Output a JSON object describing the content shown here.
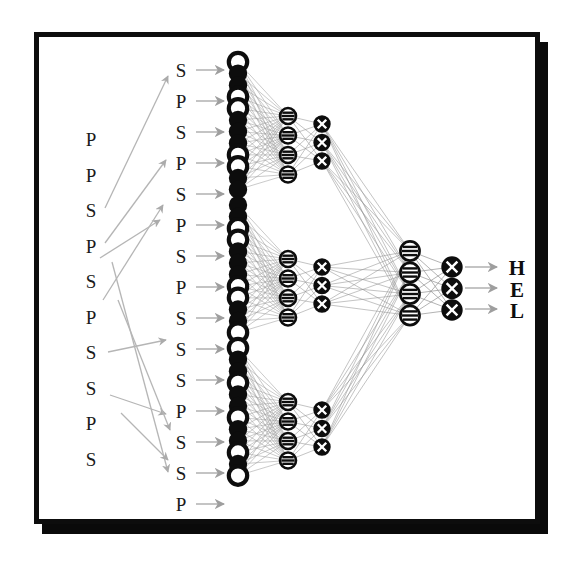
{
  "figure": {
    "kind": "neural-network-diagram",
    "caption_text": "",
    "frame": {
      "border_color": "#0d0d0d",
      "shadow_color": "#0a0a0a",
      "background": "#ffffff"
    },
    "colors": {
      "node_fill": "#0d0d0d",
      "node_hollow": "#ffffff",
      "node_stroke": "#0d0d0d",
      "edge": "#8a8a8a",
      "arrow": "#9a9a9a",
      "text": "#1a1a1a"
    }
  },
  "input_sequence": {
    "name": "outer-sequence",
    "label": "outer input letters",
    "letters": [
      "P",
      "P",
      "S",
      "P",
      "S",
      "P",
      "S",
      "S",
      "P",
      "S"
    ]
  },
  "window_sequence": {
    "name": "windowed-sequence",
    "label": "expanded windowed input letters",
    "letters": [
      "S",
      "P",
      "S",
      "P",
      "S",
      "P",
      "S",
      "P",
      "S",
      "S",
      "S",
      "P",
      "S",
      "S",
      "P"
    ]
  },
  "output_labels": {
    "name": "output-letters",
    "letters": [
      "H",
      "E",
      "L"
    ]
  },
  "layers": [
    {
      "id": "input-layer",
      "label": "Input layer",
      "glyph": "solid-or-hollow-circle",
      "groups": [
        {
          "id": "input-group-1",
          "nodes": [
            "hollow",
            "solid",
            "solid",
            "hollow",
            "hollow",
            "solid",
            "solid",
            "solid",
            "hollow",
            "hollow",
            "solid",
            "solid"
          ]
        },
        {
          "id": "input-group-2",
          "nodes": [
            "solid",
            "solid",
            "hollow",
            "hollow",
            "solid",
            "solid",
            "solid",
            "hollow",
            "hollow",
            "solid",
            "solid",
            "hollow"
          ]
        },
        {
          "id": "input-group-3",
          "nodes": [
            "hollow",
            "solid",
            "solid",
            "hollow",
            "solid",
            "solid",
            "hollow",
            "solid",
            "solid",
            "hollow",
            "solid",
            "hollow"
          ]
        }
      ]
    },
    {
      "id": "hidden-layer-1",
      "label": "First hidden layer",
      "glyph": "striped-circle",
      "groups": [
        {
          "id": "h1-group-1",
          "count": 4
        },
        {
          "id": "h1-group-2",
          "count": 4
        },
        {
          "id": "h1-group-3",
          "count": 4
        }
      ]
    },
    {
      "id": "hidden-layer-2",
      "label": "Second hidden layer",
      "glyph": "crossed-circle",
      "groups": [
        {
          "id": "h2-group-1",
          "count": 3
        },
        {
          "id": "h2-group-2",
          "count": 3
        },
        {
          "id": "h2-group-3",
          "count": 3
        }
      ]
    },
    {
      "id": "hidden-layer-3",
      "label": "Merge hidden layer",
      "glyph": "striped-circle",
      "groups": [
        {
          "id": "h3-group",
          "count": 4
        }
      ]
    },
    {
      "id": "output-layer",
      "label": "Output layer",
      "glyph": "crossed-circle",
      "groups": [
        {
          "id": "out-group",
          "count": 3
        }
      ]
    }
  ]
}
